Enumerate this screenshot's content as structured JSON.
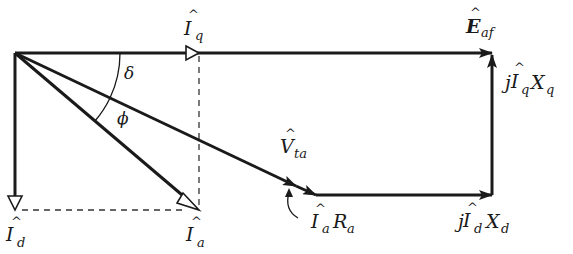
{
  "diagram": {
    "type": "phasor-diagram",
    "colors": {
      "line": "#1a1a1a",
      "background": "#ffffff"
    },
    "phasors": [
      {
        "id": "Iq",
        "label_main": "I",
        "label_sub": "q",
        "hat": true,
        "from": "origin",
        "direction": "horizontal-right",
        "arrow": "open-triangle"
      },
      {
        "id": "Id",
        "label_main": "I",
        "label_sub": "d",
        "hat": true,
        "from": "origin",
        "direction": "vertical-down",
        "arrow": "open-triangle"
      },
      {
        "id": "Ia",
        "label_main": "I",
        "label_sub": "a",
        "hat": true,
        "from": "origin",
        "direction": "diagonal-down-right",
        "arrow": "open-triangle"
      },
      {
        "id": "Vta",
        "label_main": "V",
        "label_sub": "ta",
        "hat": true,
        "from": "origin",
        "direction": "diagonal-down-right",
        "arrow": "filled"
      },
      {
        "id": "IaRa",
        "label_prefix": "",
        "label_main": "I",
        "label_sub": "a",
        "label_suffix": "R",
        "label_suffix_sub": "a",
        "hat": true
      },
      {
        "id": "jIdXd",
        "label_prefix": "j",
        "label_main": "I",
        "label_sub": "d",
        "label_suffix": "X",
        "label_suffix_sub": "d",
        "hat": true
      },
      {
        "id": "jIqXq",
        "label_prefix": "j",
        "label_main": "I",
        "label_sub": "q",
        "label_suffix": "X",
        "label_suffix_sub": "q",
        "hat": true
      },
      {
        "id": "Eaf",
        "label_main": "E",
        "label_sub": "af",
        "hat": true,
        "bold": true
      }
    ],
    "angles": [
      {
        "id": "delta",
        "symbol": "δ",
        "between": [
          "Eaf",
          "Vta"
        ]
      },
      {
        "id": "phi",
        "symbol": "ϕ",
        "between": [
          "Vta",
          "Ia"
        ]
      }
    ],
    "labels": {
      "hat": "^",
      "Iq": {
        "main": "I",
        "sub": "q"
      },
      "Id": {
        "main": "I",
        "sub": "d"
      },
      "Ia": {
        "main": "I",
        "sub": "a"
      },
      "Vta": {
        "main": "V",
        "sub": "ta"
      },
      "Eaf": {
        "main": "E",
        "sub": "af"
      },
      "IaRa": {
        "main": "I",
        "sub": "a",
        "suffix": "R",
        "suffix_sub": "a"
      },
      "jIdXd": {
        "prefix": "j",
        "main": "I",
        "sub": "d",
        "suffix": "X",
        "suffix_sub": "d"
      },
      "jIqXq": {
        "prefix": "j",
        "main": "I",
        "sub": "q",
        "suffix": "X",
        "suffix_sub": "q"
      },
      "delta": "δ",
      "phi": "ϕ"
    }
  }
}
